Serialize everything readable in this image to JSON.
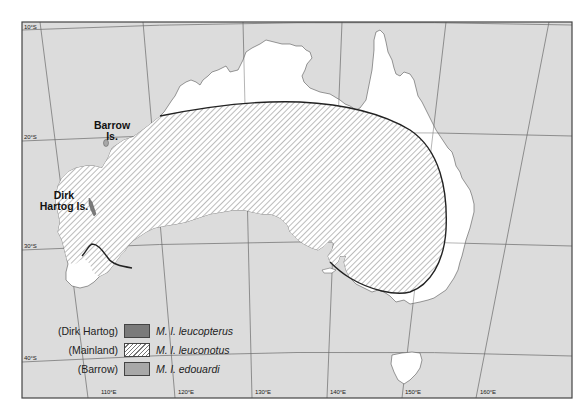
{
  "map": {
    "colors": {
      "sea": "#dcdcdc",
      "land": "#ffffff",
      "grid": "#6a6a6a",
      "frame": "#444444",
      "range_outline": "#222222",
      "hatch": "#7a7a7a",
      "dirk_hartog": "#7a7a7a",
      "barrow": "#a8a8a8"
    },
    "latitude_labels": [
      {
        "text": "10°S"
      },
      {
        "text": "20°S"
      },
      {
        "text": "30°S"
      },
      {
        "text": "40°S"
      }
    ],
    "longitude_labels": [
      {
        "text": "110°E"
      },
      {
        "text": "120°E"
      },
      {
        "text": "130°E"
      },
      {
        "text": "140°E"
      },
      {
        "text": "150°E"
      },
      {
        "text": "160°E"
      }
    ],
    "islands": {
      "barrow": {
        "line1": "Barrow",
        "line2": "Is."
      },
      "dirk_hartog": {
        "line1": "Dirk",
        "line2": "Hartog Is."
      }
    }
  },
  "legend": {
    "items": [
      {
        "region": "(Dirk Hartog)",
        "species": "M. l. leucopterus",
        "swatch": "solid-dark"
      },
      {
        "region": "(Mainland)",
        "species": "M. l. leuconotus",
        "swatch": "hatched"
      },
      {
        "region": "(Barrow)",
        "species": "M. l. edouardi",
        "swatch": "solid-light"
      }
    ]
  }
}
